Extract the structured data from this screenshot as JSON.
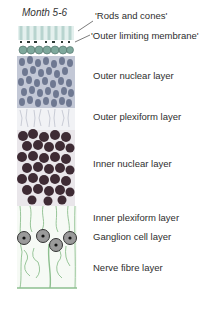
{
  "figure": {
    "title": "Month 5-6",
    "labels": [
      {
        "id": "rods-and-cones",
        "text": "'Rods and cones'",
        "x": 95,
        "y": 14
      },
      {
        "id": "outer-limiting-membrane",
        "text": "'Outer limiting membrane'",
        "x": 91,
        "y": 30
      },
      {
        "id": "outer-nuclear-layer",
        "text": "Outer nuclear layer",
        "x": 93,
        "y": 73
      },
      {
        "id": "outer-plexiform-layer",
        "text": "Outer plexiform layer",
        "x": 93,
        "y": 113
      },
      {
        "id": "inner-nuclear-layer",
        "text": "Inner nuclear layer",
        "x": 93,
        "y": 159
      },
      {
        "id": "inner-plexiform-layer",
        "text": "Inner plexiform layer",
        "x": 93,
        "y": 213
      },
      {
        "id": "ganglion-cell-layer",
        "text": "Ganglion cell layer",
        "x": 93,
        "y": 232
      },
      {
        "id": "nerve-fibre-layer",
        "text": "Nerve fibre layer",
        "x": 93,
        "y": 263
      }
    ],
    "colors": {
      "rods": "#b8d4cf",
      "limiting_membrane": "#2e3b36",
      "outer_nuclei": "#6e7891",
      "outer_nuclei_light": "#9aa3ba",
      "plexiform": "#c9ccd6",
      "inner_nuclei": "#3e2b34",
      "fibres": "#8dbf8f",
      "ganglion": "#4a4a4a",
      "leader_line": "#444444"
    }
  }
}
